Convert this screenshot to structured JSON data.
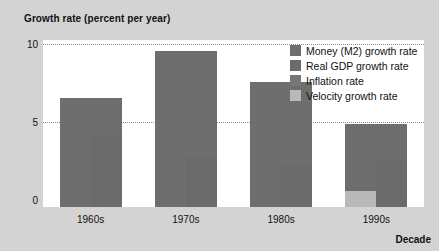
{
  "chart_data": {
    "type": "bar",
    "title": "Growth rate (percent per year)",
    "ylabel": "Growth rate (percent per year)",
    "xlabel": "Decade",
    "categories": [
      "1960s",
      "1970s",
      "1980s",
      "1990s"
    ],
    "ylim": [
      0,
      10
    ],
    "yticks": [
      "0",
      "5",
      "10"
    ],
    "ytick_values": [
      0,
      5,
      10
    ],
    "grid": "horizontal dotted at 5 and 10",
    "legend_position": "inside top-right",
    "series": [
      {
        "name": "Money (M2) growth rate",
        "color": "#6e6e6e",
        "values": [
          7.0,
          10.0,
          8.0,
          5.3
        ]
      },
      {
        "name": "Real GDP growth rate",
        "color": "#6b6b6b",
        "values": [
          4.6,
          3.2,
          2.7,
          3.0
        ]
      },
      {
        "name": "Inflation rate",
        "color": "#767676",
        "values": [
          2.4,
          6.8,
          5.3,
          2.3
        ]
      },
      {
        "name": "Velocity growth rate",
        "color": "#b9b9b9",
        "values": [
          0.0,
          0.0,
          0.0,
          1.0
        ]
      }
    ]
  },
  "axes": {
    "y_title": "Growth rate (percent per year)",
    "x_title": "Decade",
    "y_ticks": [
      "10",
      "5",
      "0"
    ],
    "x_ticks": [
      "1960s",
      "1970s",
      "1980s",
      "1990s"
    ]
  },
  "legend": {
    "items": [
      {
        "label": "Money (M2) growth rate",
        "color": "#6e6e6e"
      },
      {
        "label": "Real GDP growth rate",
        "color": "#6b6b6b"
      },
      {
        "label": "Inflation rate",
        "color": "#767676"
      },
      {
        "label": "Velocity growth rate",
        "color": "#b9b9b9"
      }
    ]
  }
}
